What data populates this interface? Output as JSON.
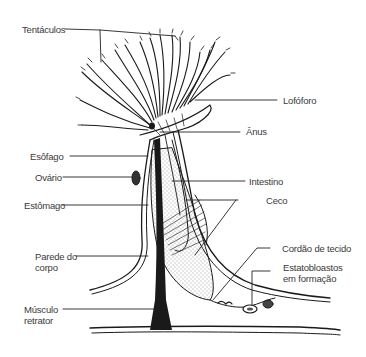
{
  "diagram": {
    "labels": {
      "tentaculos": "Tentáculos",
      "lofoforo": "Lofóforo",
      "anus": "Ânus",
      "esofago": "Esôfago",
      "ovario": "Ovário",
      "intestino": "Intestino",
      "estomago": "Estômago",
      "ceco": "Ceco",
      "parede_l1": "Parede do",
      "parede_l2": "corpo",
      "cordao": "Cordão de tecido",
      "estato_l1": "Estatobloastos",
      "estato_l2": "em formação",
      "musculo_l1": "Músculo",
      "musculo_l2": "retrator"
    },
    "colors": {
      "ink": "#1a1a1a",
      "label_text": "#3a3a3a",
      "background": "#ffffff"
    }
  }
}
